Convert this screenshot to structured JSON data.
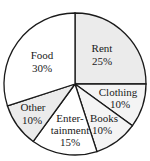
{
  "chart_data": {
    "type": "pie",
    "title": "",
    "start_angle_deg": 0,
    "direction": "clockwise",
    "slices": [
      {
        "label": "Rent",
        "label_lines": [
          "Rent",
          "25%"
        ],
        "value": 25,
        "percent_label": "25%",
        "color": "#ebebeb"
      },
      {
        "label": "Clothing",
        "label_lines": [
          "Clothing",
          "10%"
        ],
        "value": 10,
        "percent_label": "10%",
        "color": "#f4f4f4"
      },
      {
        "label": "Books",
        "label_lines": [
          "Books",
          "10%"
        ],
        "value": 10,
        "percent_label": "10%",
        "color": "#f4f4f4"
      },
      {
        "label": "Entertainment",
        "label_lines": [
          "Enter-",
          "tainment",
          "15%"
        ],
        "value": 15,
        "percent_label": "15%",
        "color": "#ffffff"
      },
      {
        "label": "Other",
        "label_lines": [
          "Other",
          "10%"
        ],
        "value": 10,
        "percent_label": "10%",
        "color": "#ebebeb"
      },
      {
        "label": "Food",
        "label_lines": [
          "Food",
          "30%"
        ],
        "value": 30,
        "percent_label": "30%",
        "color": "#ffffff"
      }
    ],
    "legend": "none (labels inside slices)"
  },
  "labels": {
    "rent": {
      "name": "Rent",
      "pct": "25%"
    },
    "clothing": {
      "name": "Clothing",
      "pct": "10%"
    },
    "books": {
      "name": "Books",
      "pct": "10%"
    },
    "entertainment": {
      "name1": "Enter-",
      "name2": "tainment",
      "pct": "15%"
    },
    "other": {
      "name": "Other",
      "pct": "10%"
    },
    "food": {
      "name": "Food",
      "pct": "30%"
    }
  }
}
